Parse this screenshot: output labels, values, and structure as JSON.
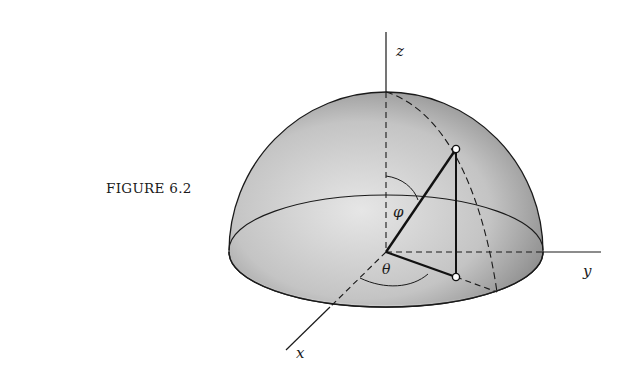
{
  "figure": {
    "caption": "FIGURE 6.2",
    "axes": {
      "x": "x",
      "y": "y",
      "z": "z"
    },
    "angles": {
      "polar": "φ",
      "azimuthal": "θ"
    },
    "colors": {
      "ink": "#1a1a1a",
      "shade_dark": "#6e6e6e",
      "shade_light": "#e2e2e2",
      "background": "#ffffff"
    }
  }
}
